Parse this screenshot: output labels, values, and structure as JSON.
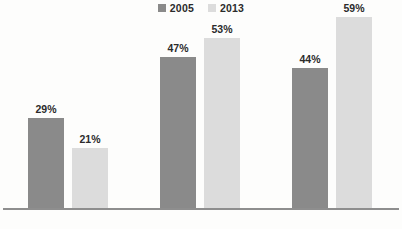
{
  "chart_data": {
    "type": "bar",
    "title": "",
    "subtitle": "",
    "xlabel": "",
    "ylabel": "",
    "ylim": [
      0,
      65
    ],
    "grid": false,
    "legend_position": "top-center",
    "value_suffix": "%",
    "categories": [
      "",
      "",
      ""
    ],
    "series": [
      {
        "name": "2005",
        "color": "#8a8a8a",
        "values": [
          29,
          47,
          44
        ],
        "labels": [
          "29%",
          "47%",
          "44%"
        ]
      },
      {
        "name": "2013",
        "color": "#dcdcdc",
        "values": [
          21,
          53,
          59
        ],
        "labels": [
          "21%",
          "53%",
          "59%"
        ]
      }
    ]
  },
  "legend": {
    "entries": [
      {
        "label": "2005",
        "color": "#8a8a8a"
      },
      {
        "label": "2013",
        "color": "#dcdcdc"
      }
    ]
  },
  "bars": [
    {
      "value_label": "29%",
      "series": "2005",
      "color": "#8a8a8a",
      "left": 28,
      "width": 36,
      "top": 118
    },
    {
      "value_label": "21%",
      "series": "2013",
      "color": "#dcdcdc",
      "left": 72,
      "width": 36,
      "top": 148
    },
    {
      "value_label": "47%",
      "series": "2005",
      "color": "#8a8a8a",
      "left": 160,
      "width": 36,
      "top": 57
    },
    {
      "value_label": "53%",
      "series": "2013",
      "color": "#dcdcdc",
      "left": 204,
      "width": 36,
      "top": 38
    },
    {
      "value_label": "44%",
      "series": "2005",
      "color": "#8a8a8a",
      "left": 292,
      "width": 36,
      "top": 68
    },
    {
      "value_label": "59%",
      "series": "2013",
      "color": "#dcdcdc",
      "left": 336,
      "width": 36,
      "top": 17
    }
  ],
  "axis": {
    "baseline_color": "#8e8e8e"
  },
  "category_labels": [
    {
      "text": "",
      "left": 10,
      "width": 120
    },
    {
      "text": "",
      "left": 142,
      "width": 120
    },
    {
      "text": "",
      "left": 274,
      "width": 120
    }
  ]
}
